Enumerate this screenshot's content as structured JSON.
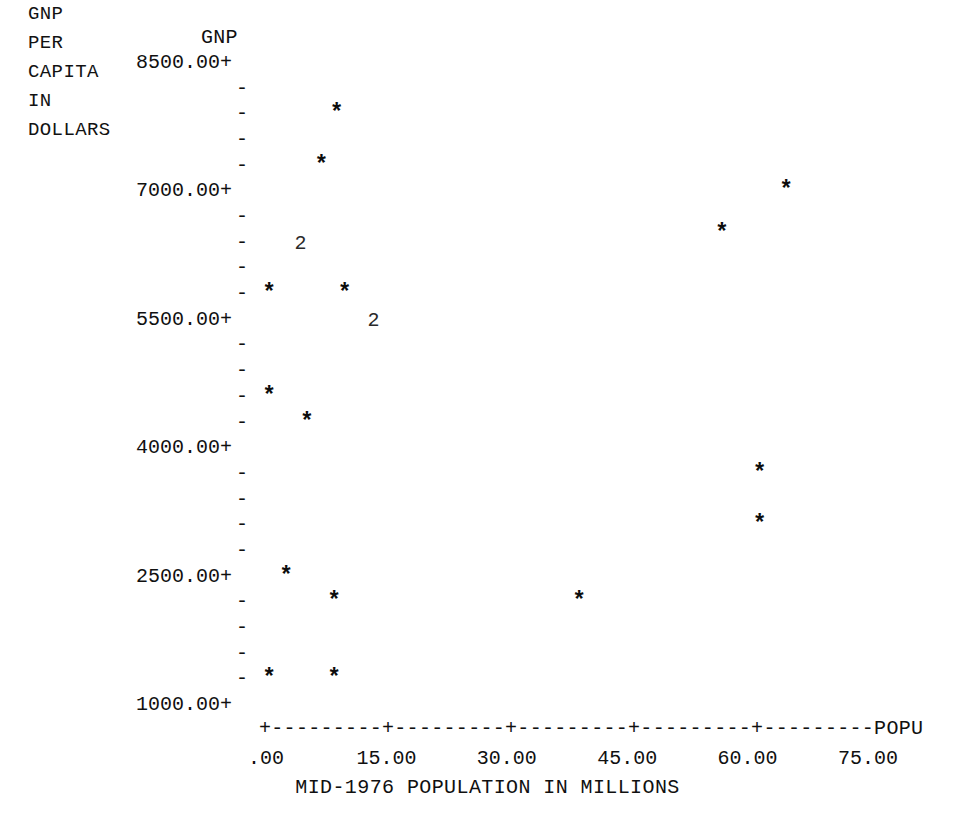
{
  "chart_title": "GNP",
  "y_axis": {
    "caption_lines": [
      "GNP",
      "PER",
      "CAPITA",
      "IN",
      "DOLLARS"
    ],
    "major_ticks": [
      {
        "label": "8500.00+",
        "value": 8500
      },
      {
        "label": "7000.00+",
        "value": 7000
      },
      {
        "label": "5500.00+",
        "value": 5500
      },
      {
        "label": "4000.00+",
        "value": 4000
      },
      {
        "label": "2500.00+",
        "value": 2500
      },
      {
        "label": "1000.00+",
        "value": 1000
      }
    ],
    "minor_glyph": "-",
    "major_glyph": "+"
  },
  "x_axis": {
    "line": "+---------+---------+---------+---------+---------POPU",
    "end_label": "POPU",
    "caption": "MID-1976 POPULATION IN MILLIONS",
    "tick_labels": [
      ".00",
      "15.00",
      "30.00",
      "45.00",
      "60.00",
      "75.00"
    ],
    "tick_values": [
      0,
      15,
      30,
      45,
      60,
      75
    ]
  },
  "chart_data": {
    "type": "scatter",
    "title": "GNP",
    "xlabel": "MID-1976 POPULATION IN MILLIONS",
    "ylabel": "GNP PER CAPITA IN DOLLARS",
    "xlim": [
      0,
      78
    ],
    "ylim": [
      850,
      8500
    ],
    "grid": false,
    "legend": null,
    "marker_symbol": "*",
    "overlap_note": "A digit (e.g. 2) in place of * means that many observations fall in the same plot cell.",
    "points": [
      {
        "x": 8.8,
        "y": 7900,
        "marker": "*",
        "count": 1
      },
      {
        "x": 6.9,
        "y": 7300,
        "marker": "*",
        "count": 1
      },
      {
        "x": 64.8,
        "y": 7000,
        "marker": "*",
        "count": 1
      },
      {
        "x": 56.8,
        "y": 6500,
        "marker": "*",
        "count": 1
      },
      {
        "x": 4.3,
        "y": 6400,
        "marker": "2",
        "count": 2
      },
      {
        "x": 0.4,
        "y": 5800,
        "marker": "*",
        "count": 1
      },
      {
        "x": 9.8,
        "y": 5800,
        "marker": "*",
        "count": 1
      },
      {
        "x": 13.4,
        "y": 5500,
        "marker": "2",
        "count": 2
      },
      {
        "x": 0.4,
        "y": 4600,
        "marker": "*",
        "count": 1
      },
      {
        "x": 5.1,
        "y": 4300,
        "marker": "*",
        "count": 1
      },
      {
        "x": 61.5,
        "y": 3700,
        "marker": "*",
        "count": 1
      },
      {
        "x": 61.5,
        "y": 3100,
        "marker": "*",
        "count": 1
      },
      {
        "x": 2.5,
        "y": 2500,
        "marker": "*",
        "count": 1
      },
      {
        "x": 8.5,
        "y": 2200,
        "marker": "*",
        "count": 1
      },
      {
        "x": 39.0,
        "y": 2200,
        "marker": "*",
        "count": 1
      },
      {
        "x": 0.4,
        "y": 1300,
        "marker": "*",
        "count": 1
      },
      {
        "x": 8.5,
        "y": 1300,
        "marker": "*",
        "count": 1
      }
    ]
  },
  "geometry": {
    "y_top_value": 8500,
    "y_bottom_value": 1000,
    "y_top_px": 63,
    "y_bottom_px": 705,
    "x_left_value": 0,
    "x_right_value": 75,
    "x_left_px": 266,
    "x_right_px": 868,
    "tick_glyph_x_px": 236,
    "y_label_right_px": 232,
    "caption_block_top_px": 230
  }
}
